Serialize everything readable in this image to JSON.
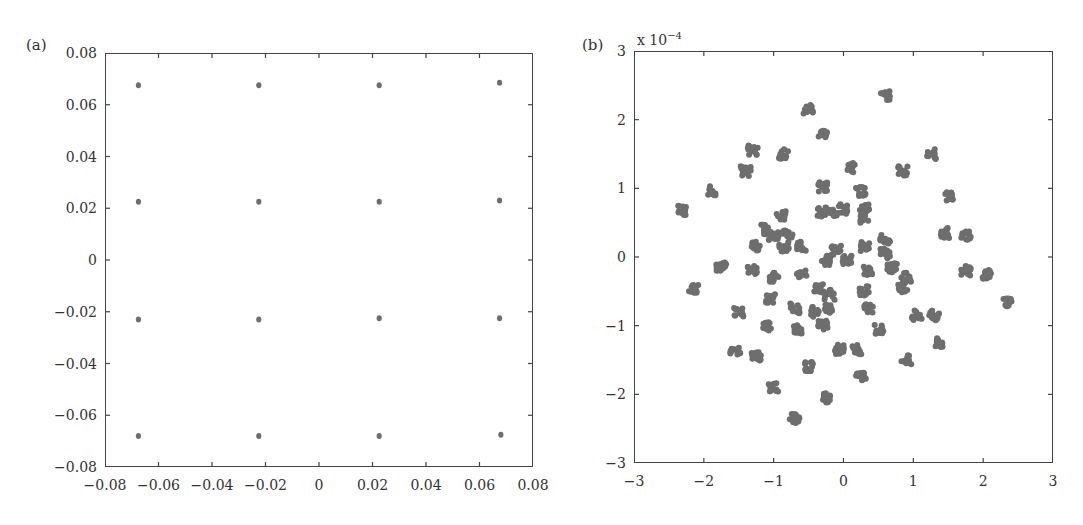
{
  "panels": {
    "a": {
      "label": "(a)"
    },
    "b": {
      "label": "(b)",
      "exponent_prefix": "x 10",
      "exponent_power": "−4"
    }
  },
  "colors": {
    "point": "#6e6e6e",
    "axis": "#444444"
  },
  "chart_data": [
    {
      "type": "scatter",
      "title": "(a)",
      "xlabel": "",
      "ylabel": "",
      "xlim": [
        -0.08,
        0.08
      ],
      "ylim": [
        -0.08,
        0.08
      ],
      "xticks": [
        "−0.08",
        "−0.06",
        "−0.04",
        "−0.02",
        "0",
        "0.02",
        "0.04",
        "0.06",
        "0.08"
      ],
      "yticks": [
        "−0.08",
        "−0.06",
        "−0.04",
        "−0.02",
        "0",
        "0.02",
        "0.04",
        "0.06",
        "0.08"
      ],
      "grid": false,
      "description": "16-point square constellation (4x4 grid)",
      "points": [
        [
          -0.0675,
          0.0675
        ],
        [
          -0.0225,
          0.0675
        ],
        [
          0.0225,
          0.0675
        ],
        [
          0.0675,
          0.0685
        ],
        [
          -0.0675,
          0.0225
        ],
        [
          -0.0225,
          0.0225
        ],
        [
          0.0225,
          0.0225
        ],
        [
          0.0675,
          0.023
        ],
        [
          -0.0675,
          -0.023
        ],
        [
          -0.0225,
          -0.023
        ],
        [
          0.0225,
          -0.0225
        ],
        [
          0.0675,
          -0.0225
        ],
        [
          -0.0675,
          -0.068
        ],
        [
          -0.0225,
          -0.068
        ],
        [
          0.0225,
          -0.068
        ],
        [
          0.068,
          -0.0675
        ]
      ]
    },
    {
      "type": "scatter",
      "title": "(b)",
      "xlabel": "",
      "ylabel": "",
      "scale_annotation": "x 10^-4",
      "xlim": [
        -3,
        3
      ],
      "ylim": [
        -3,
        3
      ],
      "xticks": [
        "−3",
        "−2",
        "−1",
        "0",
        "1",
        "2",
        "3"
      ],
      "yticks": [
        "−3",
        "−2",
        "−1",
        "0",
        "1",
        "2",
        "3"
      ],
      "grid": false,
      "description": "Scattered clusters of received symbols (values in units of 1e-4)",
      "clusters": [
        [
          -0.5,
          2.15
        ],
        [
          0.6,
          2.35
        ],
        [
          -0.3,
          1.8
        ],
        [
          -1.3,
          1.55
        ],
        [
          -0.85,
          1.5
        ],
        [
          1.25,
          1.5
        ],
        [
          0.1,
          1.3
        ],
        [
          0.85,
          1.25
        ],
        [
          -1.4,
          1.25
        ],
        [
          -1.9,
          0.97
        ],
        [
          1.5,
          0.88
        ],
        [
          0.25,
          0.95
        ],
        [
          0.3,
          0.7
        ],
        [
          -0.3,
          1.02
        ],
        [
          -2.3,
          0.68
        ],
        [
          -0.3,
          0.65
        ],
        [
          0.0,
          0.7
        ],
        [
          -0.15,
          0.65
        ],
        [
          0.3,
          0.55
        ],
        [
          -0.9,
          0.6
        ],
        [
          -1.15,
          0.4
        ],
        [
          -0.8,
          0.35
        ],
        [
          -1.0,
          0.3
        ],
        [
          1.45,
          0.35
        ],
        [
          1.75,
          0.3
        ],
        [
          -1.25,
          0.15
        ],
        [
          -0.85,
          0.15
        ],
        [
          -0.6,
          0.15
        ],
        [
          -0.1,
          0.1
        ],
        [
          0.3,
          0.15
        ],
        [
          0.6,
          0.25
        ],
        [
          0.6,
          0.05
        ],
        [
          -1.75,
          -0.15
        ],
        [
          -0.25,
          -0.05
        ],
        [
          0.05,
          -0.05
        ],
        [
          0.35,
          -0.2
        ],
        [
          0.7,
          -0.15
        ],
        [
          0.9,
          -0.3
        ],
        [
          0.85,
          -0.45
        ],
        [
          1.75,
          -0.2
        ],
        [
          -0.6,
          -0.25
        ],
        [
          -1.0,
          -0.3
        ],
        [
          -2.15,
          -0.45
        ],
        [
          -1.3,
          -0.2
        ],
        [
          2.05,
          -0.25
        ],
        [
          -0.35,
          -0.45
        ],
        [
          -0.2,
          -0.55
        ],
        [
          0.3,
          -0.5
        ],
        [
          -1.05,
          -0.6
        ],
        [
          -0.7,
          -0.75
        ],
        [
          -0.4,
          -0.8
        ],
        [
          -0.2,
          -0.75
        ],
        [
          -1.5,
          -0.8
        ],
        [
          0.35,
          -0.75
        ],
        [
          1.05,
          -0.85
        ],
        [
          1.3,
          -0.85
        ],
        [
          2.35,
          -0.65
        ],
        [
          -1.1,
          -1.0
        ],
        [
          -0.65,
          -1.05
        ],
        [
          0.5,
          -1.05
        ],
        [
          -0.3,
          -1.0
        ],
        [
          -1.55,
          -1.35
        ],
        [
          -1.25,
          -1.45
        ],
        [
          -0.05,
          -1.35
        ],
        [
          0.2,
          -1.35
        ],
        [
          1.35,
          -1.25
        ],
        [
          0.9,
          -1.5
        ],
        [
          -0.5,
          -1.6
        ],
        [
          -1.0,
          -1.9
        ],
        [
          -0.25,
          -2.05
        ],
        [
          0.25,
          -1.75
        ],
        [
          -0.7,
          -2.35
        ]
      ]
    }
  ]
}
